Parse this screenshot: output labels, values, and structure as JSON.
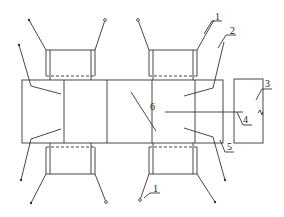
{
  "diagram": {
    "type": "technical-schematic",
    "colors": {
      "stroke": "#333333",
      "background": "#ffffff"
    },
    "labels": [
      {
        "id": "1a",
        "text": "1",
        "x": 216,
        "y": 22
      },
      {
        "id": "2",
        "text": "2",
        "x": 231,
        "y": 39
      },
      {
        "id": "3",
        "text": "3",
        "x": 265,
        "y": 88
      },
      {
        "id": "4",
        "text": "4",
        "x": 243,
        "y": 123
      },
      {
        "id": "5",
        "text": "5",
        "x": 227,
        "y": 152
      },
      {
        "id": "6",
        "text": "6",
        "x": 154,
        "y": 113
      },
      {
        "id": "1b",
        "text": "1",
        "x": 153,
        "y": 193
      }
    ]
  }
}
